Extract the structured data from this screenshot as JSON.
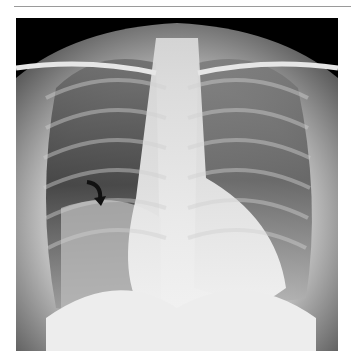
{
  "figure": {
    "type": "chest-radiograph",
    "view": "PA",
    "annotation": {
      "icon": "curved-arrow-icon",
      "color": "#111111"
    }
  },
  "colors": {
    "background": "#ffffff",
    "rule": "#9a9a9a",
    "film": "#000000"
  }
}
